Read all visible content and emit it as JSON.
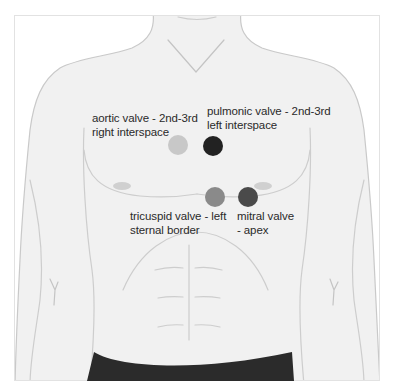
{
  "diagram": {
    "colors": {
      "skin": "#f1f1f1",
      "outline": "#c9c9c9",
      "muscle_line": "#d2d2d2",
      "nipple": "#cfcfcf",
      "shorts": "#2b2b2b",
      "frame_border": "#e2e2e2",
      "label_text": "#2a2a2a"
    },
    "valves": [
      {
        "id": "aortic",
        "label_line1": "aortic valve - 2nd-3rd",
        "label_line2": "right interspace",
        "color": "#c8c8c8"
      },
      {
        "id": "pulmonic",
        "label_line1": "pulmonic valve - 2nd-3rd",
        "label_line2": "left interspace",
        "color": "#222222"
      },
      {
        "id": "tricuspid",
        "label_line1": "tricuspid valve - left",
        "label_line2": "sternal border",
        "color": "#8a8a8a"
      },
      {
        "id": "mitral",
        "label_line1": "mitral valve",
        "label_line2": "- apex",
        "color": "#4a4a4a"
      }
    ]
  }
}
